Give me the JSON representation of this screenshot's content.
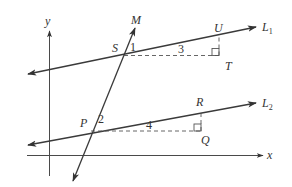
{
  "diagram": {
    "axes": {
      "x_label": "x",
      "y_label": "y"
    },
    "lines": {
      "l1": {
        "label": "L",
        "subscript": "1"
      },
      "l2": {
        "label": "L",
        "subscript": "2"
      },
      "m": {
        "label": "M"
      }
    },
    "points": {
      "s": "S",
      "t": "T",
      "u": "U",
      "p": "P",
      "q": "Q",
      "r": "R"
    },
    "angles": {
      "angle1": "1",
      "angle2": "2"
    },
    "segment_lengths": {
      "st": "3",
      "pq": "4"
    },
    "colors": {
      "line": "#3a3a3a",
      "background": "#ffffff"
    }
  }
}
